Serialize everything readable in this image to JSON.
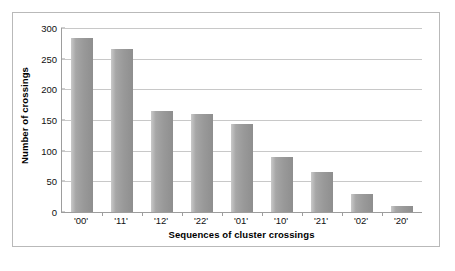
{
  "chart_data": {
    "type": "bar",
    "title": "",
    "xlabel": "Sequences of cluster crossings",
    "ylabel": "Number of crossings",
    "categories": [
      "'00'",
      "'11'",
      "'12'",
      "'22'",
      "'01'",
      "'10'",
      "'21'",
      "'02'",
      "'20'"
    ],
    "values": [
      283,
      266,
      165,
      160,
      143,
      89,
      65,
      29,
      10
    ],
    "ylim": [
      0,
      300
    ],
    "yticks": [
      0,
      50,
      100,
      150,
      200,
      250,
      300
    ],
    "ytick_labels": [
      "0",
      "50",
      "100",
      "150",
      "200",
      "250",
      "300"
    ],
    "grid": "horizontal",
    "legend": "none",
    "bar_color": "#9a9a9a",
    "gridline_color": "#c8c8c8",
    "axis_color": "#9d9d9d",
    "border_color": "#b9b9b9",
    "background_color": "#ffffff"
  }
}
